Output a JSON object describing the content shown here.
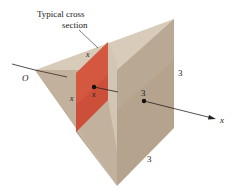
{
  "figure": {
    "callout": {
      "line1": "Typical cross",
      "line2": "section"
    },
    "labels": {
      "origin": "O",
      "cross_section_top_side": "x",
      "cross_section_left_side": "x",
      "cross_section_center": "x",
      "base_center": "3",
      "base_right_side": "3",
      "base_bottom_side": "3",
      "axis": "x"
    },
    "colors": {
      "solid_light": "#c9b9a6",
      "solid_mid": "#b8a793",
      "solid_dark": "#a99680",
      "solid_highlight": "#ddd0c0",
      "cross_section": "#d4573f",
      "cross_section_dark": "#c34a33",
      "axis": "#222222"
    }
  }
}
